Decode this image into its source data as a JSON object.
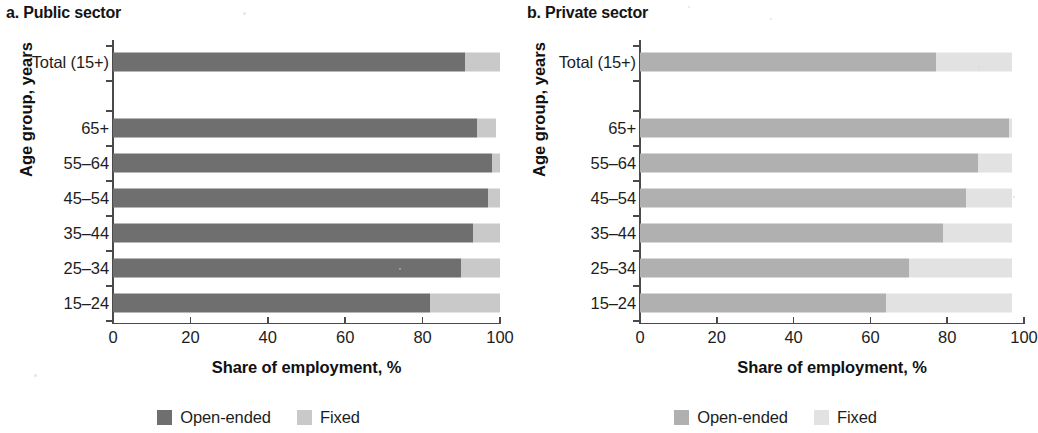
{
  "figure": {
    "xaxis_title": "Share of employment, %",
    "yaxis_title": "Age group, years",
    "xticks": [
      "0",
      "20",
      "40",
      "60",
      "80",
      "100"
    ],
    "categories": [
      "Total (15+)",
      "65+",
      "55–64",
      "45–54",
      "35–44",
      "25–34",
      "15–24"
    ],
    "series_names": [
      "Open-ended",
      "Fixed"
    ]
  },
  "panels": {
    "left": {
      "title": "a. Public sector",
      "legend": [
        {
          "label": "Open-ended",
          "color": "#706f6f"
        },
        {
          "label": "Fixed",
          "color": "#c9c9c9"
        }
      ]
    },
    "right": {
      "title": "b. Private sector",
      "legend": [
        {
          "label": "Open-ended",
          "color": "#b0b0b0"
        },
        {
          "label": "Fixed",
          "color": "#e2e2e2"
        }
      ]
    }
  },
  "chart_data": [
    {
      "type": "bar",
      "orientation": "horizontal",
      "stacked": true,
      "title": "a. Public sector",
      "xlabel": "Share of employment, %",
      "ylabel": "Age group, years",
      "xlim": [
        0,
        100
      ],
      "xticks": [
        0,
        20,
        40,
        60,
        80,
        100
      ],
      "grid": false,
      "legend_position": "bottom",
      "categories": [
        "Total (15+)",
        "65+",
        "55–64",
        "45–54",
        "35–44",
        "25–34",
        "15–24"
      ],
      "series": [
        {
          "name": "Open-ended",
          "color": "#706f6f",
          "values": [
            91,
            94,
            98,
            97,
            93,
            90,
            82
          ]
        },
        {
          "name": "Fixed",
          "color": "#c9c9c9",
          "values": [
            9,
            5,
            2,
            3,
            7,
            10,
            18
          ]
        }
      ]
    },
    {
      "type": "bar",
      "orientation": "horizontal",
      "stacked": true,
      "title": "b. Private sector",
      "xlabel": "Share of employment, %",
      "ylabel": "Age group, years",
      "xlim": [
        0,
        100
      ],
      "xticks": [
        0,
        20,
        40,
        60,
        80,
        100
      ],
      "grid": false,
      "legend_position": "bottom",
      "categories": [
        "Total (15+)",
        "65+",
        "55–64",
        "45–54",
        "35–44",
        "25–34",
        "15–24"
      ],
      "series": [
        {
          "name": "Open-ended",
          "color": "#b0b0b0",
          "values": [
            77,
            96,
            88,
            85,
            79,
            70,
            64
          ]
        },
        {
          "name": "Fixed",
          "color": "#e2e2e2",
          "values": [
            20,
            1,
            9,
            12,
            18,
            27,
            33
          ]
        }
      ]
    }
  ]
}
